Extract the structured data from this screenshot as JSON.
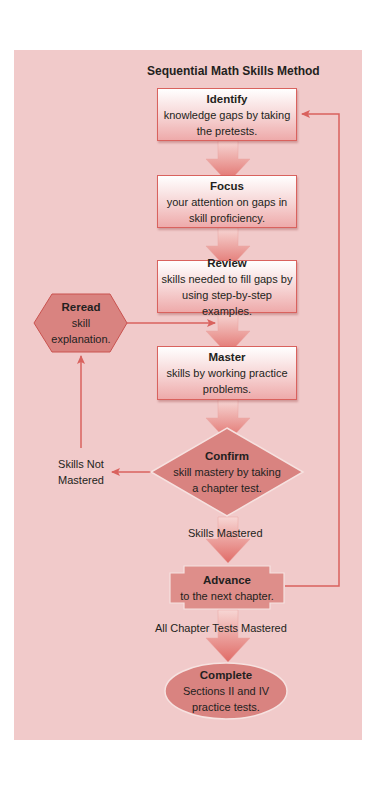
{
  "title": "Sequential Math Skills Method",
  "colors": {
    "panel": "#f1caca",
    "arrow": "#e2736e",
    "line": "#d9625e",
    "shape_fill": "#d98380"
  },
  "steps": [
    {
      "heading": "Identify",
      "lines": [
        "knowledge gaps by taking",
        "the pretests."
      ]
    },
    {
      "heading": "Focus",
      "lines": [
        "your attention on gaps in",
        "skill proficiency."
      ]
    },
    {
      "heading": "Review",
      "lines": [
        "skills needed to fill gaps by",
        "using step-by-step examples."
      ]
    },
    {
      "heading": "Master",
      "lines": [
        "skills by working practice",
        "problems."
      ]
    },
    {
      "heading": "Confirm",
      "lines": [
        "skill mastery by taking",
        "a chapter test."
      ]
    },
    {
      "heading": "Advance",
      "lines": [
        "to the next chapter."
      ]
    },
    {
      "heading": "Complete",
      "lines": [
        "Sections II and IV",
        "practice tests."
      ]
    }
  ],
  "reread": {
    "heading": "Reread",
    "lines": [
      "skill",
      "explanation."
    ]
  },
  "labels": {
    "not_mastered": [
      "Skills Not",
      "Mastered"
    ],
    "mastered": "Skills Mastered",
    "all_mastered": "All Chapter Tests Mastered"
  }
}
